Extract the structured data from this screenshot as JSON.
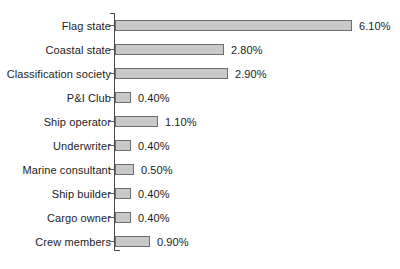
{
  "chart_data": {
    "type": "bar",
    "orientation": "horizontal",
    "title": "",
    "subtitle": "",
    "xlabel": "",
    "ylabel": "",
    "grid": false,
    "legend": null,
    "legend_position": "none",
    "xlim": [
      0,
      6.1
    ],
    "value_suffix": "%",
    "categories": [
      "Flag state",
      "Coastal state",
      "Classification society",
      "P&I Club",
      "Ship operator",
      "Underwriter",
      "Marine consultant",
      "Ship builder",
      "Cargo owner",
      "Crew members"
    ],
    "values": [
      6.1,
      2.8,
      2.9,
      0.4,
      1.1,
      0.4,
      0.5,
      0.4,
      0.4,
      0.9
    ],
    "data_labels": [
      "6.10%",
      "2.80%",
      "2.90%",
      "0.40%",
      "1.10%",
      "0.40%",
      "0.50%",
      "0.40%",
      "0.40%",
      "0.90%"
    ],
    "series": [
      {
        "name": "",
        "values": [
          6.1,
          2.8,
          2.9,
          0.4,
          1.1,
          0.4,
          0.5,
          0.4,
          0.4,
          0.9
        ]
      }
    ]
  },
  "style": {
    "bar_fill": "#c9c9c9",
    "bar_stroke": "#6e6e6e",
    "axis_color": "#4a4a4a",
    "text_color": "#1c1c1c",
    "background": "#ffffff"
  }
}
